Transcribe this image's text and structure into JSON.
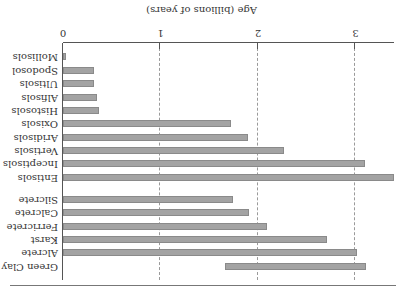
{
  "chart_data": {
    "type": "bar",
    "orientation": "horizontal",
    "rendered_rotation_deg": 180,
    "title": "",
    "xlabel": "Age (billions of years)",
    "ylabel": "",
    "xlim": [
      0,
      3.5
    ],
    "xticks": [
      "0",
      "1",
      "2",
      "3"
    ],
    "grid": "vertical dashed at x ticks",
    "groups": [
      {
        "name": "Soil orders",
        "categories": [
          "Mollisols",
          "Spodosol",
          "Ultisols",
          "Alfisols",
          "Histosols",
          "Oxisols",
          "Aridisols",
          "Vertisols",
          "Inceptisols",
          "Entisols"
        ],
        "start": [
          0,
          0,
          0,
          0,
          0,
          0,
          0,
          0,
          0,
          0
        ],
        "values": [
          0.03,
          0.32,
          0.32,
          0.35,
          0.37,
          1.72,
          1.9,
          2.27,
          3.1,
          3.4
        ]
      },
      {
        "name": "Paleosol features",
        "categories": [
          "Silcrete",
          "Calcrete",
          "Ferricrete",
          "Karst",
          "Alcrete",
          "Green Clay"
        ],
        "start": [
          0,
          0,
          0,
          0,
          0,
          1.66
        ],
        "values": [
          1.74,
          1.91,
          2.09,
          2.71,
          3.02,
          3.11
        ]
      }
    ],
    "bar_color": "#a3a3a3",
    "bar_border": "#8a8a8a"
  },
  "axis": {
    "title": "Age (billions of years)",
    "ticks": [
      {
        "label": "0",
        "value": 0
      },
      {
        "label": "1",
        "value": 1
      },
      {
        "label": "2",
        "value": 2
      },
      {
        "label": "3",
        "value": 3
      }
    ]
  },
  "rows": [
    {
      "label": "Mollisols",
      "start": 0,
      "end": 0.03
    },
    {
      "label": "Spodosol",
      "start": 0,
      "end": 0.32
    },
    {
      "label": "Ultisols",
      "start": 0,
      "end": 0.32
    },
    {
      "label": "Alfisols",
      "start": 0,
      "end": 0.35
    },
    {
      "label": "Histosols",
      "start": 0,
      "end": 0.37
    },
    {
      "label": "Oxisols",
      "start": 0,
      "end": 1.72
    },
    {
      "label": "Aridisols",
      "start": 0,
      "end": 1.9
    },
    {
      "label": "Vertisols",
      "start": 0,
      "end": 2.27
    },
    {
      "label": "Inceptisols",
      "start": 0,
      "end": 3.1
    },
    {
      "label": "Entisols",
      "start": 0,
      "end": 3.4
    },
    {
      "label": "Silcrete",
      "start": 0,
      "end": 1.74
    },
    {
      "label": "Calcrete",
      "start": 0,
      "end": 1.91
    },
    {
      "label": "Ferricrete",
      "start": 0,
      "end": 2.09
    },
    {
      "label": "Karst",
      "start": 0,
      "end": 2.71
    },
    {
      "label": "Alcrete",
      "start": 0,
      "end": 3.02
    },
    {
      "label": "Green Clay",
      "start": 1.66,
      "end": 3.11
    }
  ]
}
